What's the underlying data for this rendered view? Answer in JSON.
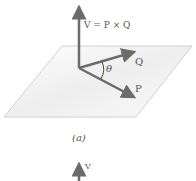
{
  "figure": {
    "equation_label": "V = P × Q",
    "vector_q_label": "Q",
    "vector_p_label": "P",
    "angle_label": "θ",
    "caption": "(a)",
    "second_figure_vector_label": "V",
    "colors": {
      "arrow": "#6b6b6b",
      "plane_edge": "#cfcfcf",
      "plane_fill": "#f3f3f3",
      "text": "#555555"
    }
  }
}
